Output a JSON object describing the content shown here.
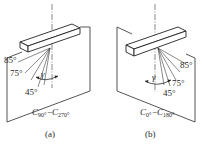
{
  "figure": {
    "panels": [
      {
        "id": "a",
        "caption": "(a)",
        "plane_label": {
          "prefix": "C",
          "from_sub": "90°",
          "dash": "−",
          "to_prefix": "C",
          "to_sub": "270°"
        },
        "angle_labels": [
          "85°",
          "75°",
          "45°"
        ],
        "angle_symbol": "γ"
      },
      {
        "id": "b",
        "caption": "(b)",
        "plane_label": {
          "prefix": "C",
          "from_sub": "0°",
          "dash": "−",
          "to_prefix": "C",
          "to_sub": "180°"
        },
        "angle_labels": [
          "85°",
          "75°",
          "45°"
        ],
        "angle_symbol": "γ"
      }
    ]
  }
}
